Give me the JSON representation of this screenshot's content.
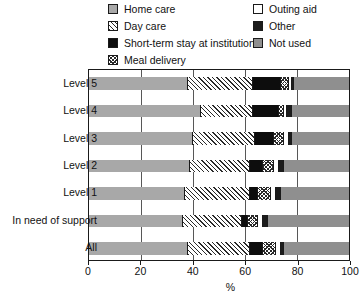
{
  "chart_data": {
    "type": "bar",
    "orientation": "horizontal",
    "stacked": true,
    "title": "",
    "xlabel": "%",
    "ylabel": "",
    "xlim": [
      0,
      100
    ],
    "xticks": [
      0,
      20,
      40,
      60,
      80,
      100
    ],
    "grid": true,
    "legend_position": "top",
    "categories": [
      "Level 5",
      "Level 4",
      "Level 3",
      "Level 2",
      "Level 1",
      "In need of support",
      "All"
    ],
    "series": [
      {
        "name": "Home care",
        "key": "home",
        "pattern": "solid-gray",
        "color": "#a8a8a8",
        "values": [
          38,
          43,
          40,
          39,
          37,
          36,
          38
        ]
      },
      {
        "name": "Day care",
        "key": "day",
        "pattern": "diagonal-hatch",
        "color": "#ffffff",
        "values": [
          25,
          20,
          24,
          23,
          25,
          23,
          24
        ]
      },
      {
        "name": "Short-term stay at institution",
        "key": "short",
        "pattern": "solid-black",
        "color": "#0d0d0d",
        "values": [
          11,
          10,
          7,
          5,
          3,
          2,
          5
        ]
      },
      {
        "name": "Meal delivery",
        "key": "meal",
        "pattern": "cross-hatch",
        "color": "#ffffff",
        "values": [
          3,
          2,
          4,
          4,
          5,
          4,
          5
        ]
      },
      {
        "name": "Outing aid",
        "key": "outing",
        "pattern": "solid-white",
        "color": "#ffffff",
        "values": [
          1,
          1,
          2,
          2,
          2,
          2,
          2
        ]
      },
      {
        "name": "Other",
        "key": "other",
        "pattern": "solid-black",
        "color": "#1c1c1c",
        "values": [
          1,
          2,
          1,
          2,
          2,
          2,
          1
        ]
      },
      {
        "name": "Not used",
        "key": "notused",
        "pattern": "solid-gray",
        "color": "#8f8f8f",
        "values": [
          21,
          22,
          22,
          25,
          26,
          31,
          25
        ]
      }
    ]
  },
  "legend": {
    "left_column": [
      {
        "label": "Home care",
        "swatch": "home"
      },
      {
        "label": "Day care",
        "swatch": "day"
      },
      {
        "label": "Short-term stay at institution",
        "swatch": "short"
      },
      {
        "label": "Meal delivery",
        "swatch": "meal"
      }
    ],
    "right_column": [
      {
        "label": "Outing aid",
        "swatch": "outing"
      },
      {
        "label": "Other",
        "swatch": "other"
      },
      {
        "label": "Not used",
        "swatch": "notused"
      }
    ]
  },
  "axis": {
    "x_tick_labels": [
      "0",
      "20",
      "40",
      "60",
      "80",
      "100"
    ],
    "x_title": "%",
    "y_tick_labels": [
      "Level 5",
      "Level 4",
      "Level 3",
      "Level 2",
      "Level 1",
      "In need of support",
      "All"
    ]
  }
}
